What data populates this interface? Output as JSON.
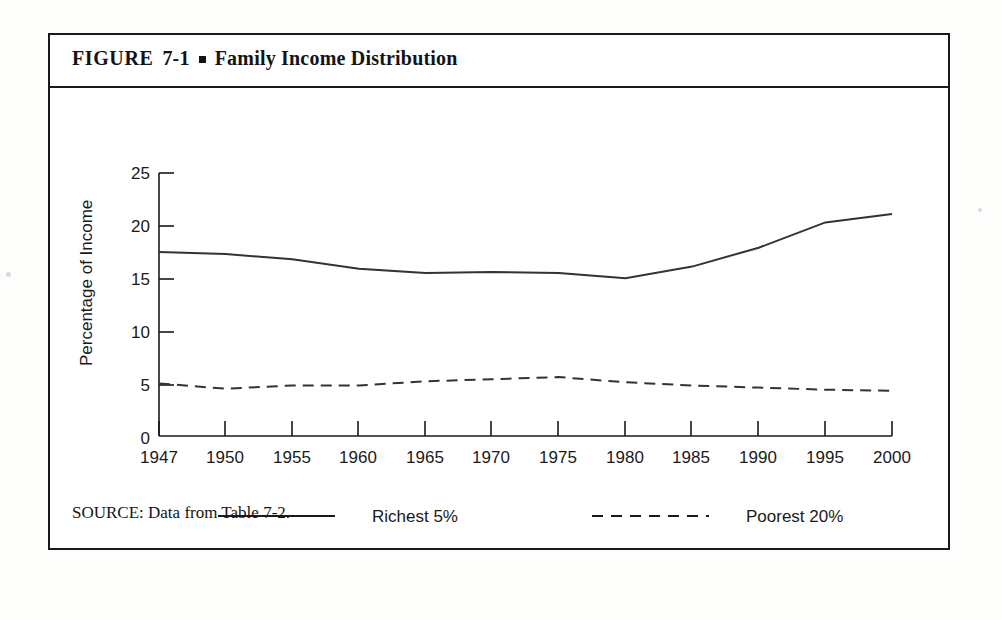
{
  "figure": {
    "label_word": "FIGURE",
    "number": "7-1",
    "bullet": "square-bullet",
    "title": "Family Income Distribution",
    "source_note": "SOURCE: Data from Table 7-2."
  },
  "legend": {
    "position": "below-axis",
    "entries": [
      {
        "label": "Richest 5%",
        "style": "solid",
        "swatch": "solid-line-swatch"
      },
      {
        "label": "Poorest 20%",
        "style": "dashed",
        "swatch": "dashed-line-swatch"
      }
    ]
  },
  "colors": {
    "ink": "#1a1a1a",
    "line": "#333333",
    "frame": "#1a1a1a",
    "paper": "#ffffff"
  },
  "chart_data": {
    "type": "line",
    "title": "Family Income Distribution",
    "xlabel": "",
    "ylabel": "Percentage of Income",
    "categories": [
      "1947",
      "1950",
      "1955",
      "1960",
      "1965",
      "1970",
      "1975",
      "1980",
      "1985",
      "1990",
      "1995",
      "2000"
    ],
    "xtick_labels": [
      "1947",
      "1950",
      "1955",
      "1960",
      "1965",
      "1970",
      "1975",
      "1980",
      "1985",
      "1990",
      "1995",
      "2000"
    ],
    "ytick_labels": [
      "0",
      "5",
      "10",
      "15",
      "20",
      "25"
    ],
    "yticks": [
      0,
      5,
      10,
      15,
      20,
      25
    ],
    "ylim": [
      0,
      25
    ],
    "grid": false,
    "legend_position": "bottom",
    "series": [
      {
        "name": "Richest 5%",
        "style": "solid",
        "values": [
          17.5,
          17.3,
          16.8,
          15.9,
          15.5,
          15.6,
          15.5,
          15.0,
          16.1,
          17.9,
          20.3,
          21.1
        ]
      },
      {
        "name": "Poorest 20%",
        "style": "dashed",
        "values": [
          5.0,
          4.5,
          4.8,
          4.8,
          5.2,
          5.4,
          5.6,
          5.1,
          4.8,
          4.6,
          4.4,
          4.3
        ]
      }
    ]
  }
}
